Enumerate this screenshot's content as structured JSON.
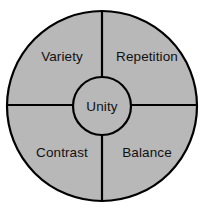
{
  "diagram": {
    "type": "wheel-quadrant-diagram",
    "hub": {
      "label": "Unity",
      "center_x": 102,
      "center_y": 106,
      "radius": 29,
      "fill_color": "#b8b8b8"
    },
    "outer": {
      "center_x": 102,
      "center_y": 106,
      "radius": 96,
      "fill_color": "#b8b8b8",
      "stroke_color": "#000000"
    },
    "colors": {
      "background": "#ffffff",
      "ring_fill": "#b8b8b8",
      "stroke": "#000000",
      "text": "#111111"
    },
    "dividers": {
      "vertical_x": 102,
      "horizontal_y": 105,
      "stroke_width": 2
    },
    "sectors": [
      {
        "id": "upper-left",
        "label": "Variety",
        "label_x": 62,
        "label_y": 57
      },
      {
        "id": "upper-right",
        "label": "Repetition",
        "label_x": 147,
        "label_y": 57
      },
      {
        "id": "lower-left",
        "label": "Contrast",
        "label_x": 62,
        "label_y": 153
      },
      {
        "id": "lower-right",
        "label": "Balance",
        "label_x": 147,
        "label_y": 153
      }
    ]
  }
}
